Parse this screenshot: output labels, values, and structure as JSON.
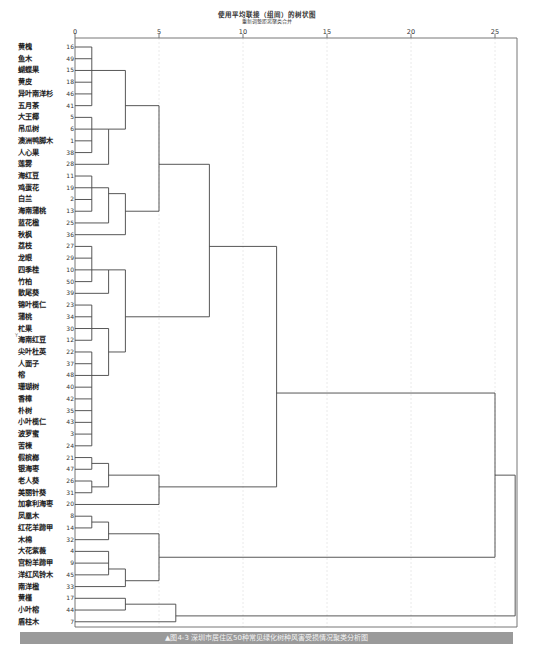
{
  "chart_data": {
    "type": "dendrogram",
    "title": "使用平均联接（组间）的树状图",
    "subtitle": "重新调整距离聚类合并",
    "xlabel": "",
    "ylabel": "",
    "xlim": [
      0,
      25
    ],
    "x_ticks": [
      0,
      5,
      10,
      15,
      20,
      25
    ],
    "grid": true,
    "leaves": [
      {
        "name": "黄槐",
        "id": "16"
      },
      {
        "name": "鱼木",
        "id": "49"
      },
      {
        "name": "蝴蝶果",
        "id": "15"
      },
      {
        "name": "黄皮",
        "id": "18"
      },
      {
        "name": "异叶南洋杉",
        "id": "46"
      },
      {
        "name": "五月茶",
        "id": "41"
      },
      {
        "name": "大王椰",
        "id": "5"
      },
      {
        "name": "吊瓜树",
        "id": "6"
      },
      {
        "name": "澳洲鸭脚木",
        "id": "1"
      },
      {
        "name": "人心果",
        "id": "38"
      },
      {
        "name": "莲雾",
        "id": "28"
      },
      {
        "name": "海红豆",
        "id": "11"
      },
      {
        "name": "鸡蛋花",
        "id": "19"
      },
      {
        "name": "白兰",
        "id": "2"
      },
      {
        "name": "海南蒲桃",
        "id": "13"
      },
      {
        "name": "蓝花楹",
        "id": "25"
      },
      {
        "name": "秋枫",
        "id": "36"
      },
      {
        "name": "荔枝",
        "id": "27"
      },
      {
        "name": "龙眼",
        "id": "29"
      },
      {
        "name": "四季桂",
        "id": "10"
      },
      {
        "name": "竹柏",
        "id": "50"
      },
      {
        "name": "散尾葵",
        "id": "39"
      },
      {
        "name": "锦叶榄仁",
        "id": "23"
      },
      {
        "name": "蒲桃",
        "id": "34"
      },
      {
        "name": "杧果",
        "id": "30"
      },
      {
        "name": "海南红豆",
        "id": "12"
      },
      {
        "name": "尖叶杜英",
        "id": "22"
      },
      {
        "name": "人面子",
        "id": "37"
      },
      {
        "name": "榕",
        "id": "48"
      },
      {
        "name": "珊瑚树",
        "id": "40"
      },
      {
        "name": "香樟",
        "id": "42"
      },
      {
        "name": "朴树",
        "id": "35"
      },
      {
        "name": "小叶榄仁",
        "id": "43"
      },
      {
        "name": "波罗蜜",
        "id": "3"
      },
      {
        "name": "苦楝",
        "id": "24"
      },
      {
        "name": "假槟榔",
        "id": "21"
      },
      {
        "name": "银海枣",
        "id": "47"
      },
      {
        "name": "老人葵",
        "id": "26"
      },
      {
        "name": "美丽针葵",
        "id": "31"
      },
      {
        "name": "加拿利海枣",
        "id": "20"
      },
      {
        "name": "凤凰木",
        "id": "8"
      },
      {
        "name": "红花羊蹄甲",
        "id": "14"
      },
      {
        "name": "木棉",
        "id": "32"
      },
      {
        "name": "大花紫薇",
        "id": "4"
      },
      {
        "name": "宫粉羊蹄甲",
        "id": "9"
      },
      {
        "name": "洋红风铃木",
        "id": "45"
      },
      {
        "name": "南洋楹",
        "id": "33"
      },
      {
        "name": "黄槿",
        "id": "17"
      },
      {
        "name": "小叶榕",
        "id": "44"
      },
      {
        "name": "盾柱木",
        "id": "7"
      }
    ],
    "merges": [
      {
        "rows": [
          0,
          5
        ],
        "dist": 1
      },
      {
        "rows": [
          6,
          9
        ],
        "dist": 1
      },
      {
        "rows": [
          7,
          10
        ],
        "dist": 2
      },
      {
        "rows": [
          2,
          8
        ],
        "dist": 3
      },
      {
        "rows": [
          11,
          14
        ],
        "dist": 1
      },
      {
        "rows": [
          12,
          15
        ],
        "dist": 2
      },
      {
        "rows": [
          13,
          16
        ],
        "dist": 3
      },
      {
        "rows": [
          5,
          14
        ],
        "dist": 5
      },
      {
        "rows": [
          17,
          20
        ],
        "dist": 1
      },
      {
        "rows": [
          19,
          21
        ],
        "dist": 2
      },
      {
        "rows": [
          22,
          25
        ],
        "dist": 1
      },
      {
        "rows": [
          26,
          34
        ],
        "dist": 1
      },
      {
        "rows": [
          24,
          28
        ],
        "dist": 2
      },
      {
        "rows": [
          20,
          26
        ],
        "dist": 3
      },
      {
        "rows": [
          10,
          23
        ],
        "dist": 8
      },
      {
        "rows": [
          35,
          36
        ],
        "dist": 1
      },
      {
        "rows": [
          37,
          38
        ],
        "dist": 1
      },
      {
        "rows": [
          35,
          37
        ],
        "dist": 2
      },
      {
        "rows": [
          36,
          39
        ],
        "dist": 5
      },
      {
        "rows": [
          17,
          37
        ],
        "dist": 12
      },
      {
        "rows": [
          40,
          41
        ],
        "dist": 1
      },
      {
        "rows": [
          40,
          42
        ],
        "dist": 2
      },
      {
        "rows": [
          43,
          45
        ],
        "dist": 2
      },
      {
        "rows": [
          44,
          46
        ],
        "dist": 3
      },
      {
        "rows": [
          41,
          45
        ],
        "dist": 5
      },
      {
        "rows": [
          47,
          48
        ],
        "dist": 3
      },
      {
        "rows": [
          47,
          49
        ],
        "dist": 6
      },
      {
        "rows": [
          28,
          48
        ],
        "dist": 25
      },
      {
        "rows": [
          43,
          51
        ],
        "dist": 26.2
      }
    ]
  },
  "caption": "▲图4-3  深圳市居住区50种常见绿化树种风害受损情况聚类分析图",
  "ymark": "Y"
}
